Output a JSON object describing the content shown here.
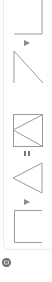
{
  "panel": {
    "frames": [
      {
        "id": "frame-1",
        "shape": "corner-bottom-right"
      },
      {
        "id": "frame-2",
        "shape": "diagonal-wedge"
      },
      {
        "id": "frame-3",
        "shape": "square-with-left-chevron"
      },
      {
        "id": "frame-4",
        "shape": "left-triangle"
      },
      {
        "id": "frame-5",
        "shape": "open-bracket"
      }
    ],
    "controls": [
      {
        "id": "play-1",
        "icon": "play-icon"
      },
      {
        "id": "pause-1",
        "icon": "pause-icon"
      },
      {
        "id": "play-2",
        "icon": "play-icon"
      }
    ]
  },
  "footer": {
    "status_icon": "circle-badge-icon"
  },
  "colors": {
    "stroke": "#9a9a9a",
    "arrow": "#8a8a8a",
    "border": "#ececec",
    "badge": "#6e6e6e"
  }
}
